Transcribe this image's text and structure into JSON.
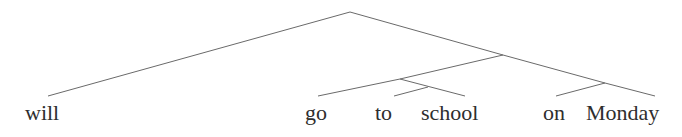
{
  "diagram": {
    "type": "syntax-tree",
    "nodes": [
      {
        "id": "root",
        "x": 350,
        "y": 12
      },
      {
        "id": "n1",
        "x": 503,
        "y": 55
      },
      {
        "id": "n2",
        "x": 400,
        "y": 79
      },
      {
        "id": "n3",
        "x": 428,
        "y": 87
      },
      {
        "id": "n4",
        "x": 605,
        "y": 83
      },
      {
        "id": "will",
        "x": 48,
        "y": 96
      },
      {
        "id": "go",
        "x": 318,
        "y": 96
      },
      {
        "id": "to",
        "x": 394,
        "y": 96
      },
      {
        "id": "school",
        "x": 465,
        "y": 96
      },
      {
        "id": "on",
        "x": 556,
        "y": 96
      },
      {
        "id": "Monday",
        "x": 655,
        "y": 96
      }
    ],
    "edges": [
      [
        "root",
        "will"
      ],
      [
        "root",
        "n1"
      ],
      [
        "n1",
        "n2"
      ],
      [
        "n1",
        "n4"
      ],
      [
        "n2",
        "go"
      ],
      [
        "n2",
        "school"
      ],
      [
        "n3",
        "to"
      ],
      [
        "n4",
        "on"
      ],
      [
        "n4",
        "Monday"
      ]
    ],
    "leaves": [
      {
        "label": "will",
        "left": 25,
        "top": 102
      },
      {
        "label": "go",
        "left": 305,
        "top": 102
      },
      {
        "label": "to",
        "left": 375,
        "top": 102
      },
      {
        "label": "school",
        "left": 421,
        "top": 102
      },
      {
        "label": "on",
        "left": 543,
        "top": 102
      },
      {
        "label": "Monday",
        "left": 586,
        "top": 102
      }
    ],
    "colors": {
      "edge": "#6a6a6a",
      "text": "#2e2e2e",
      "background": "#ffffff"
    }
  }
}
